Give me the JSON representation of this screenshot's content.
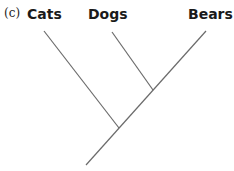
{
  "panel_label": "(c)",
  "taxa": [
    {
      "label": "Cats"
    },
    {
      "label": "Dogs"
    },
    {
      "label": "Bears"
    }
  ],
  "tree": {
    "type": "cladogram",
    "topology": "(Cats,(Dogs,Bears))",
    "line_color": "#6b6b6b"
  }
}
